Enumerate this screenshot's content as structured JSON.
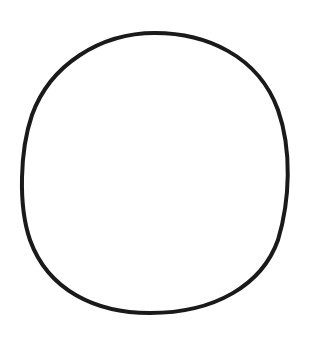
{
  "canvas": {
    "width": 313,
    "height": 340,
    "background": "#ffffff"
  },
  "shape": {
    "type": "hand-drawn-circle",
    "stroke": "#1a1a1a",
    "stroke_width": 4
  }
}
